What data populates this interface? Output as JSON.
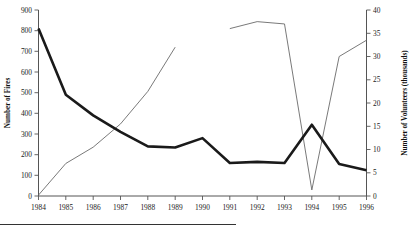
{
  "chart_data": {
    "type": "line",
    "title": "",
    "xlabel": "",
    "categories": [
      1984,
      1985,
      1986,
      1987,
      1988,
      1989,
      1990,
      1991,
      1992,
      1993,
      1994,
      1995,
      1996
    ],
    "grid": false,
    "legend": "none",
    "axes": {
      "left": {
        "label": "Number of Fires",
        "min": 0,
        "max": 900,
        "step": 100,
        "ticks": [
          "0",
          "100",
          "200",
          "300",
          "400",
          "500",
          "600",
          "700",
          "800",
          "900"
        ]
      },
      "right": {
        "label": "Number of Volunteers (thousands)",
        "min": 0,
        "max": 40,
        "step": 5,
        "ticks": [
          "0",
          "5",
          "10",
          "15",
          "20",
          "25",
          "30",
          "35",
          "40"
        ]
      },
      "bottom": {
        "ticks": [
          "1984",
          "1985",
          "1986",
          "1987",
          "1988",
          "1989",
          "1990",
          "1991",
          "1992",
          "1993",
          "1994",
          "1995",
          "1996"
        ]
      }
    },
    "series": [
      {
        "name": "Number of Fires",
        "axis": "left",
        "style": "thick-black",
        "color": "#1a1a1a",
        "x": [
          1984,
          1985,
          1986,
          1987,
          1988,
          1989,
          1990,
          1991,
          1992,
          1993,
          1994,
          1995,
          1996
        ],
        "values": [
          810,
          490,
          390,
          310,
          240,
          235,
          280,
          160,
          165,
          160,
          345,
          155,
          125
        ]
      },
      {
        "name": "Number of Volunteers (thousands)",
        "axis": "right",
        "style": "thin-grey",
        "color": "#6a6a6a",
        "gap_after": 1989,
        "x": [
          1984,
          1985,
          1986,
          1987,
          1988,
          1989,
          1991,
          1992,
          1993,
          1994,
          1995,
          1996
        ],
        "values": [
          0.2,
          7.0,
          10.5,
          15.5,
          22.5,
          32.0,
          36.0,
          37.5,
          37.0,
          1.3,
          30.0,
          33.5
        ]
      }
    ]
  }
}
